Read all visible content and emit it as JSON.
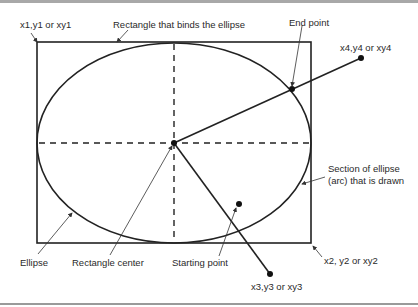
{
  "diagram": {
    "type": "ellipse-arc-geometry",
    "labels": {
      "xy1": "x1,y1 or xy1",
      "bounding_rect": "Rectangle that binds the ellipse",
      "end_point": "End point",
      "xy4": "x4,y4 or xy4",
      "arc_line1": "Section of ellipse",
      "arc_line2": "(arc) that is drawn",
      "ellipse": "Ellipse",
      "rect_center": "Rectangle center",
      "start_point": "Starting point",
      "xy2": "x2, y2 or xy2",
      "xy3": "x3,y3 or xy3"
    },
    "colors": {
      "stroke": "#222222",
      "text": "#2a2a2a",
      "rule": "#9a9a9a"
    }
  }
}
